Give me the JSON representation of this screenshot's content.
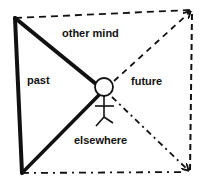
{
  "diagram": {
    "labels": {
      "other_mind": "other mind",
      "past": "past",
      "future": "future",
      "elsewhere": "elsewhere"
    },
    "colors": {
      "ink": "#111111",
      "background": "#ffffff"
    },
    "elements": {
      "figure": "stick-figure",
      "top_right_arrow": "arrow-up-right",
      "bottom_right_arrow": "arrow-down-right"
    }
  }
}
